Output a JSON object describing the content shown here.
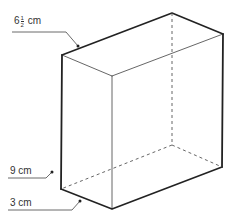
{
  "diagram": {
    "type": "rectangular-prism",
    "labels": {
      "length": {
        "whole": "6",
        "numerator": "1",
        "denominator": "2",
        "unit": "cm"
      },
      "height": {
        "value": "9 cm"
      },
      "width": {
        "value": "3 cm"
      }
    },
    "colors": {
      "edge": "#222222",
      "hidden_edge": "#555555",
      "label": "#333333"
    }
  }
}
